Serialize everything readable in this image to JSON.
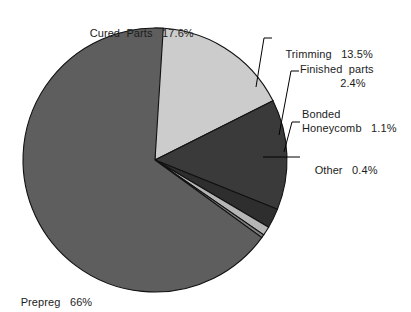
{
  "chart_data": {
    "type": "pie",
    "title": "",
    "subtitle": "",
    "xlabel": "",
    "ylabel": "",
    "legend_position": "none",
    "grid": false,
    "units": "percent",
    "total": 100,
    "start_angle_deg": 0,
    "direction": "clockwise",
    "categories": [
      "Cured Parts",
      "Trimming",
      "Finished parts",
      "Bonded Honeycomb",
      "Other",
      "Prepreg"
    ],
    "values": [
      17.6,
      13.5,
      2.4,
      1.1,
      0.4,
      66
    ],
    "slices": [
      {
        "name": "Cured Parts",
        "value": 17.6,
        "value_text": "17.6%",
        "color": "#cccccc",
        "start_deg": 0,
        "end_deg": 63.36
      },
      {
        "name": "Trimming",
        "value": 13.5,
        "value_text": "13.5%",
        "color": "#3a3a3a",
        "start_deg": 63.36,
        "end_deg": 111.96
      },
      {
        "name": "Finished parts",
        "value": 2.4,
        "value_text": "2.4%",
        "color": "#2e2e2e",
        "start_deg": 111.96,
        "end_deg": 120.6
      },
      {
        "name": "Bonded Honeycomb",
        "value": 1.1,
        "value_text": "1.1%",
        "color": "#b5b5b5",
        "start_deg": 120.6,
        "end_deg": 124.56
      },
      {
        "name": "Other",
        "value": 0.4,
        "value_text": "0.4%",
        "color": "#7d7d7d",
        "start_deg": 124.56,
        "end_deg": 126.0
      },
      {
        "name": "Prepreg",
        "value": 66,
        "value_text": "66%",
        "color": "#5e5e5e",
        "start_deg": 126.0,
        "end_deg": 360.0
      }
    ]
  },
  "labels": {
    "cured_parts": {
      "name": "Cured  Parts",
      "value": "17.6%"
    },
    "trimming": {
      "name": "Trimming",
      "value": "13.5%"
    },
    "finished_parts": {
      "name": "Finished  parts",
      "value": "2.4%"
    },
    "bonded_honeycomb": {
      "line1": "Bonded",
      "name": "Honeycomb",
      "value": "1.1%"
    },
    "other": {
      "name": "Other",
      "value": "0.4%"
    },
    "prepreg": {
      "name": "Prepreg",
      "value": "66%"
    }
  },
  "style": {
    "background": "#ffffff",
    "text_color": "#1c1c1c",
    "outline_color": "#000000",
    "leader_color": "#000000"
  }
}
